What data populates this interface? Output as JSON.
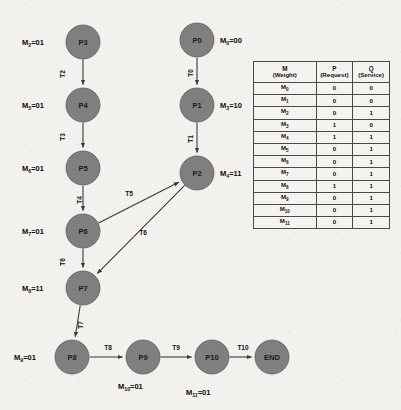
{
  "diagram": {
    "type": "petri-net-state-diagram",
    "nodes": [
      {
        "id": "P3",
        "label": "P3",
        "cx": 83,
        "cy": 42,
        "r": 17
      },
      {
        "id": "P4",
        "label": "P4",
        "cx": 83,
        "cy": 105,
        "r": 17
      },
      {
        "id": "P5",
        "label": "P5",
        "cx": 83,
        "cy": 168,
        "r": 17
      },
      {
        "id": "P6",
        "label": "P6",
        "cx": 83,
        "cy": 231,
        "r": 17
      },
      {
        "id": "P7",
        "label": "P7",
        "cx": 83,
        "cy": 288,
        "r": 17
      },
      {
        "id": "P8",
        "label": "P8",
        "cx": 72,
        "cy": 357,
        "r": 17
      },
      {
        "id": "P9",
        "label": "P9",
        "cx": 143,
        "cy": 357,
        "r": 17
      },
      {
        "id": "P10",
        "label": "P10",
        "cx": 212,
        "cy": 357,
        "r": 17
      },
      {
        "id": "END",
        "label": "END",
        "cx": 272,
        "cy": 357,
        "r": 17
      },
      {
        "id": "P0",
        "label": "P0",
        "cx": 197,
        "cy": 40,
        "r": 17
      },
      {
        "id": "P1",
        "label": "P1",
        "cx": 197,
        "cy": 105,
        "r": 17
      },
      {
        "id": "P2",
        "label": "P2",
        "cx": 197,
        "cy": 173,
        "r": 17
      }
    ],
    "edges": [
      {
        "id": "T2",
        "label": "T2",
        "from": "P3",
        "to": "P4",
        "label_x": 62,
        "label_y": 74,
        "rotated": true
      },
      {
        "id": "T3",
        "label": "T3",
        "from": "P4",
        "to": "P5",
        "label_x": 62,
        "label_y": 137,
        "rotated": true
      },
      {
        "id": "T4",
        "label": "T4",
        "from": "P5",
        "to": "P6",
        "label_x": 79,
        "label_y": 200,
        "rotated": true
      },
      {
        "id": "T6s",
        "label": "T6",
        "from": "P6",
        "to": "P7",
        "label_x": 62,
        "label_y": 262,
        "rotated": true
      },
      {
        "id": "T7",
        "label": "T7",
        "from": "P7",
        "to": "P8",
        "label_x": 80,
        "label_y": 325,
        "rotated": true
      },
      {
        "id": "T8",
        "label": "T8",
        "from": "P8",
        "to": "P9",
        "label_x": 108,
        "label_y": 347,
        "rotated": false
      },
      {
        "id": "T9",
        "label": "T9",
        "from": "P9",
        "to": "P10",
        "label_x": 176,
        "label_y": 347,
        "rotated": false
      },
      {
        "id": "T10",
        "label": "T10",
        "from": "P10",
        "to": "END",
        "label_x": 243,
        "label_y": 347,
        "rotated": false
      },
      {
        "id": "T0",
        "label": "T0",
        "from": "P0",
        "to": "P1",
        "label_x": 190,
        "label_y": 73,
        "rotated": true
      },
      {
        "id": "T1",
        "label": "T1",
        "from": "P1",
        "to": "P2",
        "label_x": 190,
        "label_y": 139,
        "rotated": true
      },
      {
        "id": "T5",
        "label": "T5",
        "from": "P6",
        "to": "P2",
        "label_x": 129,
        "label_y": 193,
        "rotated": false
      },
      {
        "id": "T6",
        "label": "T6",
        "from": "P2",
        "to": "P7",
        "label_x": 143,
        "label_y": 232,
        "rotated": false
      }
    ],
    "marking_labels": [
      {
        "id": "m2",
        "base": "M",
        "sub": "2",
        "value": "=01",
        "x": 22,
        "y": 42,
        "anchor": "start"
      },
      {
        "id": "m5",
        "base": "M",
        "sub": "5",
        "value": "=01",
        "x": 22,
        "y": 105,
        "anchor": "start"
      },
      {
        "id": "m6",
        "base": "M",
        "sub": "6",
        "value": "=01",
        "x": 22,
        "y": 168,
        "anchor": "start"
      },
      {
        "id": "m7",
        "base": "M",
        "sub": "7",
        "value": "=01",
        "x": 22,
        "y": 231,
        "anchor": "start"
      },
      {
        "id": "m8",
        "base": "M",
        "sub": "8",
        "value": "=11",
        "x": 22,
        "y": 288,
        "anchor": "start"
      },
      {
        "id": "m9",
        "base": "M",
        "sub": "9",
        "value": "=01",
        "x": 14,
        "y": 357,
        "anchor": "start"
      },
      {
        "id": "m10",
        "base": "M",
        "sub": "10",
        "value": "=01",
        "x": 118,
        "y": 386,
        "anchor": "start"
      },
      {
        "id": "m11",
        "base": "M",
        "sub": "11",
        "value": "=01",
        "x": 186,
        "y": 392,
        "anchor": "start"
      },
      {
        "id": "m0",
        "base": "M",
        "sub": "0",
        "value": "=00",
        "x": 220,
        "y": 40,
        "anchor": "start"
      },
      {
        "id": "m3",
        "base": "M",
        "sub": "3",
        "value": "=10",
        "x": 220,
        "y": 105,
        "anchor": "start"
      },
      {
        "id": "m4",
        "base": "M",
        "sub": "4",
        "value": "=11",
        "x": 220,
        "y": 173,
        "anchor": "start"
      }
    ]
  },
  "table": {
    "headers": [
      {
        "main": "M",
        "sub": "(Weight)"
      },
      {
        "main": "P",
        "sub": "(Request)"
      },
      {
        "main": "Q",
        "sub": "(Service)"
      }
    ],
    "rows": [
      {
        "m": "M",
        "m_sub": "0",
        "p": "0",
        "q": "0"
      },
      {
        "m": "M",
        "m_sub": "1",
        "p": "0",
        "q": "0"
      },
      {
        "m": "M",
        "m_sub": "2",
        "p": "0",
        "q": "1"
      },
      {
        "m": "M",
        "m_sub": "3",
        "p": "1",
        "q": "0"
      },
      {
        "m": "M",
        "m_sub": "4",
        "p": "1",
        "q": "1"
      },
      {
        "m": "M",
        "m_sub": "5",
        "p": "0",
        "q": "1"
      },
      {
        "m": "M",
        "m_sub": "6",
        "p": "0",
        "q": "1"
      },
      {
        "m": "M",
        "m_sub": "7",
        "p": "0",
        "q": "1"
      },
      {
        "m": "M",
        "m_sub": "8",
        "p": "1",
        "q": "1"
      },
      {
        "m": "M",
        "m_sub": "9",
        "p": "0",
        "q": "1"
      },
      {
        "m": "M",
        "m_sub": "10",
        "p": "0",
        "q": "1"
      },
      {
        "m": "M",
        "m_sub": "11",
        "p": "0",
        "q": "1"
      }
    ]
  },
  "colors": {
    "node_fill": "#7f7f7f",
    "node_stroke": "#5e5e5e",
    "edge": "#3a3a3a",
    "background": "#f2f1ee",
    "text": "#111111"
  }
}
